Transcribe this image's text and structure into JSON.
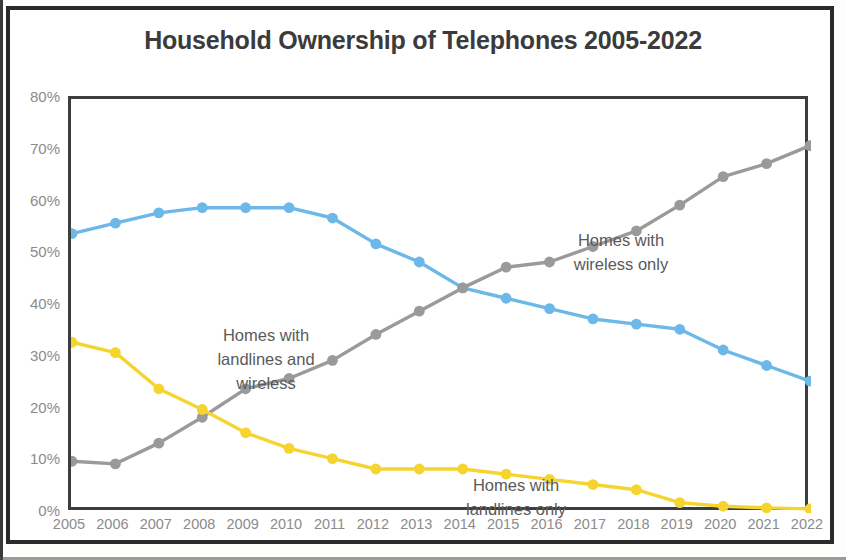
{
  "chart_data": {
    "type": "line",
    "title": "Household Ownership of Telephones 2005-2022",
    "xlabel": "",
    "ylabel": "",
    "ylim": [
      0,
      80
    ],
    "ytick_labels": [
      "80%",
      "70%",
      "60%",
      "50%",
      "40%",
      "30%",
      "20%",
      "10%",
      "0%"
    ],
    "ytick_values": [
      80,
      70,
      60,
      50,
      40,
      30,
      20,
      10,
      0
    ],
    "grid": false,
    "legend_position": "inline-annotations",
    "categories": [
      "2005",
      "2006",
      "2007",
      "2008",
      "2009",
      "2010",
      "2011",
      "2012",
      "2013",
      "2014",
      "2015",
      "2016",
      "2017",
      "2018",
      "2019",
      "2020",
      "2021",
      "2022"
    ],
    "series": [
      {
        "name": "Homes with both landlines and wireless",
        "color": "#6cb8e8",
        "values": [
          54,
          56,
          58,
          59,
          59,
          59,
          57,
          52,
          48.5,
          43.5,
          41.5,
          39.5,
          37.5,
          36.5,
          35.5,
          31.5,
          28.5,
          25.5
        ]
      },
      {
        "name": "Homes with wireless only",
        "color": "#9a9a9a",
        "values": [
          10,
          9.5,
          13.5,
          18.5,
          24,
          26,
          29.5,
          34.5,
          39,
          43.5,
          47.5,
          48.5,
          51.5,
          54.5,
          59.5,
          65,
          67.5,
          71
        ]
      },
      {
        "name": "Homes with landlines only",
        "color": "#f6d430",
        "values": [
          33,
          31,
          24,
          20,
          15.5,
          12.5,
          10.5,
          8.5,
          8.5,
          8.5,
          7.5,
          6.5,
          5.5,
          4.5,
          2,
          1.3,
          1,
          0.8
        ]
      }
    ],
    "annotations": [
      {
        "id": "both",
        "text": "Homes with\nlandlines and\nwireless"
      },
      {
        "id": "wireless",
        "text": "Homes with\nwireless only"
      },
      {
        "id": "landline",
        "text": "Homes with\nlandlines only"
      }
    ]
  }
}
